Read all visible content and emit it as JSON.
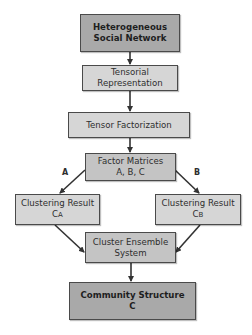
{
  "diagram": {
    "type": "flowchart",
    "nodes": [
      {
        "id": "n1",
        "lines": [
          "Heterogeneous",
          "Social Network"
        ],
        "style": "dark"
      },
      {
        "id": "n2",
        "lines": [
          "Tensorial",
          "Representation"
        ],
        "style": "light"
      },
      {
        "id": "n3",
        "lines": [
          "Tensor Factorization"
        ],
        "style": "light"
      },
      {
        "id": "n4",
        "lines": [
          "Factor Matrices",
          "A, B, C"
        ],
        "style": "mid"
      },
      {
        "id": "n5",
        "lines": [
          "Clustering Result",
          "C"
        ],
        "subscript": "A",
        "style": "light"
      },
      {
        "id": "n6",
        "lines": [
          "Clustering Result",
          "C"
        ],
        "subscript": "B",
        "style": "light"
      },
      {
        "id": "n7",
        "lines": [
          "Cluster Ensemble",
          "System"
        ],
        "style": "mid"
      },
      {
        "id": "n8",
        "lines": [
          "Community Structure",
          "C"
        ],
        "style": "dark"
      }
    ],
    "edges": [
      {
        "from": "n1",
        "to": "n2",
        "label": ""
      },
      {
        "from": "n2",
        "to": "n3",
        "label": ""
      },
      {
        "from": "n3",
        "to": "n4",
        "label": ""
      },
      {
        "from": "n4",
        "to": "n5",
        "label": "A"
      },
      {
        "from": "n4",
        "to": "n6",
        "label": "B"
      },
      {
        "from": "n5",
        "to": "n7",
        "label": ""
      },
      {
        "from": "n6",
        "to": "n7",
        "label": ""
      },
      {
        "from": "n7",
        "to": "n8",
        "label": ""
      }
    ],
    "colors": {
      "dark_fill": "#a9a9a9",
      "mid_fill": "#c4c4c4",
      "light_fill": "#d6d6d6",
      "border": "#4a4a4a",
      "arrow": "#333333"
    }
  }
}
